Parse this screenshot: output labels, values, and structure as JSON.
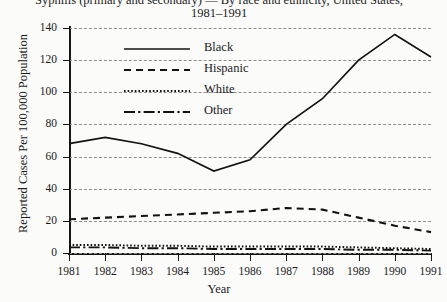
{
  "chart_data": {
    "type": "line",
    "title": "Syphilis (primary and secondary) — By race and ethnicity, United States,",
    "title_line2": "1981–1991",
    "xlabel": "Year",
    "ylabel": "Reported Cases Per 100,000 Population",
    "categories": [
      1981,
      1982,
      1983,
      1984,
      1985,
      1986,
      1987,
      1988,
      1989,
      1990,
      1991
    ],
    "xtick_labels": [
      "1981",
      "1982",
      "1983",
      "1984",
      "1985",
      "1986",
      "1987",
      "1988",
      "1989",
      "1990",
      "1991"
    ],
    "ytick_labels": [
      "0",
      "20",
      "40",
      "60",
      "80",
      "100",
      "120",
      "140"
    ],
    "ytick_values": [
      0,
      20,
      40,
      60,
      80,
      100,
      120,
      140
    ],
    "ylim": [
      0,
      140
    ],
    "xlim": [
      1981,
      1991
    ],
    "grid": "horizontal-dashed",
    "legend_position": "upper-left-inside",
    "line_color": "#121212",
    "background": "#fbfbfa",
    "series": [
      {
        "name": "Black",
        "style": "solid",
        "values": [
          68,
          72,
          68,
          62,
          51,
          58,
          80,
          96,
          120,
          136,
          122
        ]
      },
      {
        "name": "Hispanic",
        "style": "dashed",
        "values": [
          21,
          22,
          23,
          24,
          25,
          26,
          28,
          27,
          22,
          17,
          13
        ]
      },
      {
        "name": "White",
        "style": "dotted",
        "values": [
          5,
          5,
          4.5,
          4.5,
          4,
          4,
          4,
          4,
          3.5,
          3,
          2.5
        ]
      },
      {
        "name": "Other",
        "style": "dash-dot",
        "values": [
          3.5,
          3.5,
          3,
          3,
          2.5,
          2.5,
          2.5,
          2.5,
          2,
          2,
          1.5
        ]
      }
    ]
  }
}
